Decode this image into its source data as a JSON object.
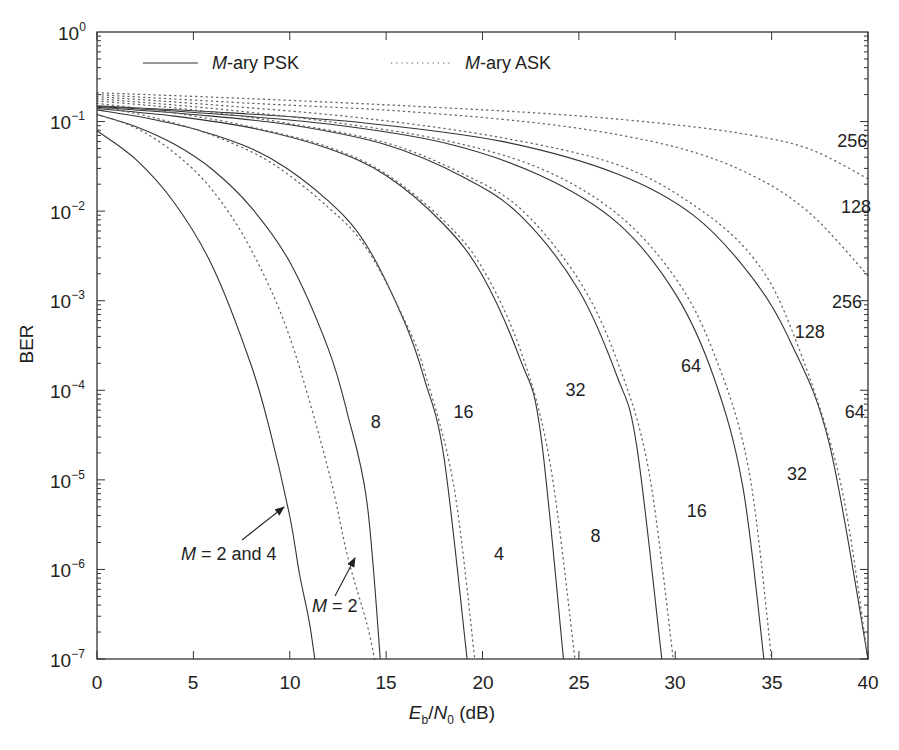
{
  "chart_data": {
    "type": "line",
    "title": "",
    "xlabel": "Eb/N0 (dB)",
    "xlabel_parts": {
      "E": "E",
      "b": "b",
      "slash": "/",
      "N": "N",
      "zero": "0",
      "unit": " (dB)"
    },
    "ylabel": "BER",
    "xlim": [
      0,
      40
    ],
    "ylim": [
      1e-07,
      1
    ],
    "yscale": "log",
    "grid": false,
    "legend_position": "top-inside",
    "x_ticks": [
      "0",
      "5",
      "10",
      "15",
      "20",
      "25",
      "30",
      "35",
      "40"
    ],
    "y_ticks": [
      {
        "base": "10",
        "exp": "0"
      },
      {
        "base": "10",
        "exp": "−1"
      },
      {
        "base": "10",
        "exp": "−2"
      },
      {
        "base": "10",
        "exp": "−3"
      },
      {
        "base": "10",
        "exp": "−4"
      },
      {
        "base": "10",
        "exp": "−5"
      },
      {
        "base": "10",
        "exp": "−6"
      },
      {
        "base": "10",
        "exp": "−7"
      }
    ],
    "legend": [
      {
        "label_italic": "M",
        "label_rest": "-ary PSK",
        "style": "solid"
      },
      {
        "label_italic": "M",
        "label_rest": "-ary ASK",
        "style": "dotted"
      }
    ],
    "series": [
      {
        "name": "PSK M=2 and 4",
        "style": "solid",
        "x": [
          0,
          2,
          4,
          6,
          8,
          9,
          10,
          10.5,
          11,
          11.3
        ],
        "y": [
          0.079,
          0.038,
          0.0125,
          0.0024,
          0.00019,
          3.36e-05,
          3.9e-06,
          9e-07,
          2.7e-07,
          1e-07
        ]
      },
      {
        "name": "PSK M=8",
        "style": "solid",
        "x": [
          0,
          2,
          4,
          6,
          8,
          10,
          12,
          13,
          14,
          14.7
        ],
        "y": [
          0.12,
          0.088,
          0.056,
          0.029,
          0.011,
          0.0027,
          0.00029,
          5.4e-05,
          5.8e-06,
          1e-07
        ]
      },
      {
        "name": "PSK M=16",
        "style": "solid",
        "x": [
          0,
          3,
          6,
          9,
          12,
          14,
          16,
          17,
          18,
          19.2
        ],
        "y": [
          0.135,
          0.105,
          0.072,
          0.039,
          0.013,
          0.0041,
          0.00055,
          0.00013,
          1.8e-05,
          1e-07
        ]
      },
      {
        "name": "PSK M=32",
        "style": "solid",
        "x": [
          0,
          4,
          8,
          12,
          15,
          18,
          20,
          22,
          23,
          24.2
        ],
        "y": [
          0.14,
          0.115,
          0.085,
          0.05,
          0.025,
          0.0071,
          0.0019,
          0.00021,
          3.5e-05,
          1e-07
        ]
      },
      {
        "name": "PSK M=64",
        "style": "solid",
        "x": [
          0,
          5,
          10,
          15,
          19,
          22,
          25,
          27,
          28,
          29.3
        ],
        "y": [
          0.145,
          0.12,
          0.092,
          0.055,
          0.024,
          0.0088,
          0.0013,
          0.00014,
          2.4e-05,
          1e-07
        ]
      },
      {
        "name": "PSK M=128",
        "style": "solid",
        "x": [
          0,
          6,
          12,
          18,
          23,
          27,
          30,
          32,
          33.5,
          34.6
        ],
        "y": [
          0.148,
          0.122,
          0.094,
          0.058,
          0.025,
          0.0074,
          0.0012,
          0.00014,
          8.5e-06,
          1e-07
        ]
      },
      {
        "name": "PSK M=256",
        "style": "solid",
        "x": [
          0,
          7,
          14,
          21,
          27,
          31,
          34,
          36,
          38,
          40
        ],
        "y": [
          0.15,
          0.125,
          0.096,
          0.06,
          0.026,
          0.0088,
          0.0018,
          0.00034,
          2.5e-05,
          1e-07
        ]
      },
      {
        "name": "ASK M=2",
        "style": "dotted",
        "x": [
          0,
          2,
          4,
          6,
          8,
          10,
          12,
          13,
          14,
          14.4
        ],
        "y": [
          0.12,
          0.085,
          0.045,
          0.017,
          0.0037,
          0.00039,
          1.3e-05,
          1.4e-06,
          2.5e-07,
          1e-07
        ]
      },
      {
        "name": "ASK M=4",
        "style": "dotted",
        "x": [
          0,
          3,
          6,
          9,
          12,
          14,
          16,
          17,
          18.5,
          19.6
        ],
        "y": [
          0.15,
          0.11,
          0.07,
          0.035,
          0.011,
          0.0038,
          0.00058,
          0.00016,
          8.8e-06,
          1e-07
        ]
      },
      {
        "name": "ASK M=8",
        "style": "dotted",
        "x": [
          0,
          4,
          8,
          12,
          15,
          18,
          20,
          22,
          23.5,
          24.8
        ],
        "y": [
          0.16,
          0.125,
          0.087,
          0.052,
          0.026,
          0.0078,
          0.0023,
          0.00027,
          1.55e-05,
          1e-07
        ]
      },
      {
        "name": "ASK M=16",
        "style": "dotted",
        "x": [
          0,
          5,
          10,
          15,
          19,
          22,
          25,
          27,
          28.6,
          29.9
        ],
        "y": [
          0.17,
          0.135,
          0.095,
          0.058,
          0.026,
          0.0105,
          0.0017,
          0.00021,
          1.35e-05,
          1e-07
        ]
      },
      {
        "name": "ASK M=32",
        "style": "dotted",
        "x": [
          0,
          6,
          12,
          18,
          23,
          27,
          30,
          32,
          33.8,
          35.0
        ],
        "y": [
          0.18,
          0.14,
          0.1,
          0.062,
          0.03,
          0.0093,
          0.0018,
          0.00026,
          1.35e-05,
          1e-07
        ]
      },
      {
        "name": "ASK M=64",
        "style": "dotted",
        "x": [
          0,
          7,
          14,
          21,
          27,
          31,
          34,
          36,
          38.5,
          40
        ],
        "y": [
          0.19,
          0.148,
          0.108,
          0.066,
          0.033,
          0.0115,
          0.0031,
          0.0005,
          1.1e-05,
          1e-07
        ]
      },
      {
        "name": "ASK M=128",
        "style": "dotted",
        "x": [
          0,
          8,
          16,
          24,
          30,
          34,
          37,
          40
        ],
        "y": [
          0.2,
          0.16,
          0.13,
          0.09,
          0.052,
          0.025,
          0.0094,
          0.0019
        ]
      },
      {
        "name": "ASK M=256",
        "style": "dotted",
        "x": [
          0,
          8,
          16,
          24,
          30,
          34,
          37,
          40
        ],
        "y": [
          0.21,
          0.18,
          0.15,
          0.12,
          0.092,
          0.07,
          0.049,
          0.023
        ]
      }
    ],
    "annotations": [
      {
        "id": "psk8",
        "text": "8",
        "x": 14.2,
        "y_px": 428
      },
      {
        "id": "psk16",
        "text": "16",
        "x": 18.5,
        "y_px": 418
      },
      {
        "id": "psk32",
        "text": "32",
        "x": 24.3,
        "y_px": 396
      },
      {
        "id": "psk64",
        "text": "64",
        "x": 30.3,
        "y_px": 372
      },
      {
        "id": "psk128",
        "text": "128",
        "x": 36.2,
        "y_px": 338
      },
      {
        "id": "psk256",
        "text": "256",
        "x": 41.4,
        "y_px": 308
      },
      {
        "id": "ask4",
        "text": "4",
        "x": 20.6,
        "y_px": 560
      },
      {
        "id": "ask8",
        "text": "8",
        "x": 25.6,
        "y_px": 542
      },
      {
        "id": "ask16",
        "text": "16",
        "x": 30.6,
        "y_px": 517
      },
      {
        "id": "ask32",
        "text": "32",
        "x": 35.8,
        "y_px": 480
      },
      {
        "id": "ask64",
        "text": "64",
        "x": 38.8,
        "y_px": 418
      },
      {
        "id": "ask128",
        "text": "128",
        "x": 38.6,
        "y_px": 213
      },
      {
        "id": "ask256",
        "text": "256",
        "x": 38.4,
        "y_px": 147
      }
    ],
    "arrow_labels": [
      {
        "id": "psk-m2-4",
        "italic": "M",
        "rest": " = 2 and 4"
      },
      {
        "id": "ask-m2",
        "italic": "M",
        "rest": " = 2"
      }
    ]
  }
}
